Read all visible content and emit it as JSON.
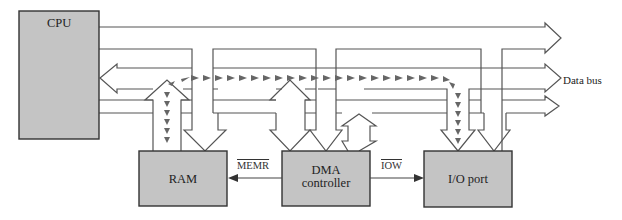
{
  "diagram": {
    "blocks": {
      "cpu": {
        "label": "CPU"
      },
      "ram": {
        "label": "RAM"
      },
      "dma": {
        "label_line1": "DMA",
        "label_line2": "controller"
      },
      "io": {
        "label": "I/O port"
      }
    },
    "signals": {
      "memr": {
        "label": "MEMR",
        "active_low": true,
        "direction": "DMA controller to RAM"
      },
      "iow": {
        "label": "IOW",
        "active_low": true,
        "direction": "DMA controller to I/O port"
      }
    },
    "buses": {
      "data_bus": {
        "label": "Data bus"
      }
    },
    "data_path": "RAM to data bus to I/O port (dashed arrows)",
    "colors": {
      "block_fill": "#c4c4c4",
      "block_stroke": "#333333",
      "line": "#555555",
      "dashed_arrow": "#666666",
      "background": "#ffffff"
    }
  }
}
